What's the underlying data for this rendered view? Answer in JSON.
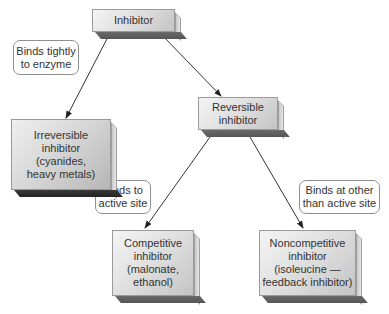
{
  "diagram": {
    "nodes": {
      "inhibitor": {
        "lines": [
          "Inhibitor"
        ]
      },
      "irreversible": {
        "lines": [
          "Irreversible",
          "inhibitor",
          "(cyanides,",
          "heavy metals)"
        ]
      },
      "reversible": {
        "lines": [
          "Reversible",
          "inhibitor"
        ]
      },
      "competitive": {
        "lines": [
          "Competitive",
          "inhibitor",
          "(malonate,",
          "ethanol)"
        ]
      },
      "noncompetitive": {
        "lines": [
          "Noncompetitive",
          "inhibitor",
          "(isoleucine —",
          "feedback inhibitor)"
        ]
      }
    },
    "edge_labels": {
      "binds_tightly": {
        "lines": [
          "Binds tightly",
          "to enzyme"
        ]
      },
      "binds_active": {
        "lines": [
          "Binds to",
          "active site"
        ]
      },
      "binds_other": {
        "lines": [
          "Binds at other",
          "than active site"
        ]
      }
    },
    "edges": [
      {
        "from": "inhibitor",
        "to": "irreversible",
        "label": "binds_tightly"
      },
      {
        "from": "inhibitor",
        "to": "reversible",
        "label": ""
      },
      {
        "from": "reversible",
        "to": "competitive",
        "label": "binds_active"
      },
      {
        "from": "reversible",
        "to": "noncompetitive",
        "label": "binds_other"
      }
    ],
    "colors": {
      "box_face": "#dcdcdc",
      "box_shadow": "#555555",
      "line": "#333333",
      "bubble_border": "#8f8f8f"
    }
  }
}
